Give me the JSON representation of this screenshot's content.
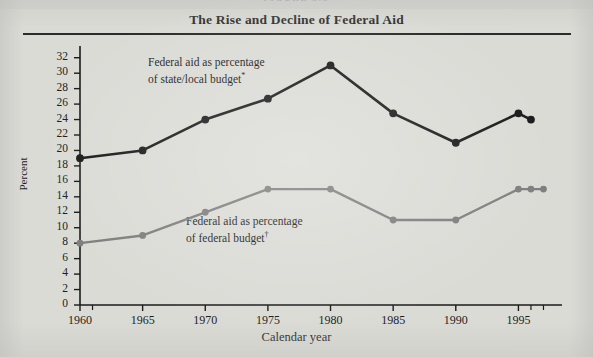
{
  "figure": {
    "cutoff_header": "FIGURE 3.3",
    "title": "The Rise and Decline of Federal Aid"
  },
  "chart_data": {
    "type": "line",
    "title": "The Rise and Decline of Federal Aid",
    "xlabel": "Calendar year",
    "ylabel": "Percent",
    "xlim": [
      1960,
      1998
    ],
    "ylim": [
      0,
      33
    ],
    "yticks": [
      0,
      2,
      4,
      6,
      8,
      10,
      12,
      14,
      16,
      18,
      20,
      22,
      24,
      26,
      28,
      30,
      32
    ],
    "xticks": [
      1960,
      1965,
      1970,
      1975,
      1980,
      1985,
      1990,
      1995
    ],
    "xtick_labels": [
      "1960",
      "1965",
      "1970",
      "1975",
      "1980",
      "1985",
      "1990",
      "1995"
    ],
    "minor_xticks": [
      1996,
      1997
    ],
    "grid": false,
    "legend": "inline-annotations",
    "series": [
      {
        "name": "Federal aid as percentage of state/local budget*",
        "color": "#1a1a1a",
        "x": [
          1960,
          1965,
          1970,
          1975,
          1980,
          1985,
          1990,
          1995,
          1996
        ],
        "values": [
          19.0,
          20.0,
          24.0,
          26.7,
          31.0,
          24.8,
          21.0,
          24.8,
          24.0
        ]
      },
      {
        "name": "Federal aid as percentage of federal budget†",
        "color": "#7e7e7e",
        "x": [
          1960,
          1965,
          1970,
          1975,
          1980,
          1985,
          1990,
          1995,
          1996,
          1997
        ],
        "values": [
          8.0,
          9.0,
          12.0,
          15.0,
          15.0,
          11.0,
          11.0,
          15.0,
          15.0,
          15.0
        ]
      }
    ],
    "annotations": [
      {
        "id": "upper",
        "line1": "Federal aid as percentage",
        "line2": "of state/local budget",
        "marker": "*"
      },
      {
        "id": "lower",
        "line1": "Federal aid as percentage",
        "line2": "of federal budget",
        "marker": "†"
      }
    ]
  }
}
